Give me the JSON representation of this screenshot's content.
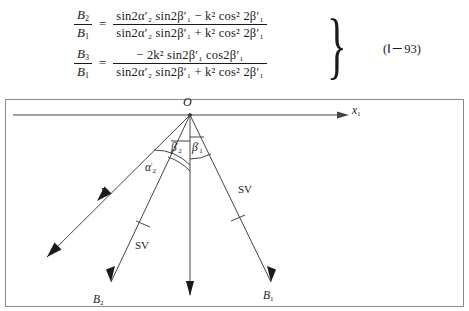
{
  "equations": {
    "eq1": {
      "lhs_num": "B",
      "lhs_num_sub": "2",
      "lhs_den": "B",
      "lhs_den_sub": "1",
      "equals": "=",
      "numerator": "sin2α′₂ sin2β′₁ − k² cos² 2β′₁",
      "denominator": "sin2α′₂ sin2β′₁ + k² cos² 2β′₁"
    },
    "eq2": {
      "lhs_num": "B",
      "lhs_num_sub": "3",
      "lhs_den": "B",
      "lhs_den_sub": "1",
      "equals": "=",
      "numerator": "− 2k² sin2β′₁ cos2β′₁",
      "denominator": "sin2α′₂ sin2β′₁ + k² cos² 2β′₁"
    },
    "brace": "}",
    "number": "(Ⅰ－93)"
  },
  "diagram": {
    "origin_label": "O",
    "axis_label": "x",
    "axis_label_sub": "1",
    "angles": [
      {
        "name": "alpha-2-prime",
        "label": "α",
        "prime": "′",
        "sub": "2"
      },
      {
        "name": "beta-2-prime",
        "label": "β",
        "prime": "′",
        "sub": "2"
      },
      {
        "name": "beta-1-prime",
        "label": "β",
        "prime": "′",
        "sub": "1"
      }
    ],
    "wave_labels": [
      {
        "name": "p-wave-label",
        "text": "P"
      },
      {
        "name": "sv-wave-left-label",
        "text": "SV"
      },
      {
        "name": "sv-wave-right-label",
        "text": "SV"
      }
    ],
    "amplitude_labels": [
      {
        "name": "b2-label",
        "text": "B",
        "sub": "2"
      },
      {
        "name": "b1-label",
        "text": "B",
        "sub": "1"
      }
    ],
    "colors": {
      "stroke": "#444444",
      "border": "#8a8a8a",
      "text": "#1a1a1a"
    }
  }
}
